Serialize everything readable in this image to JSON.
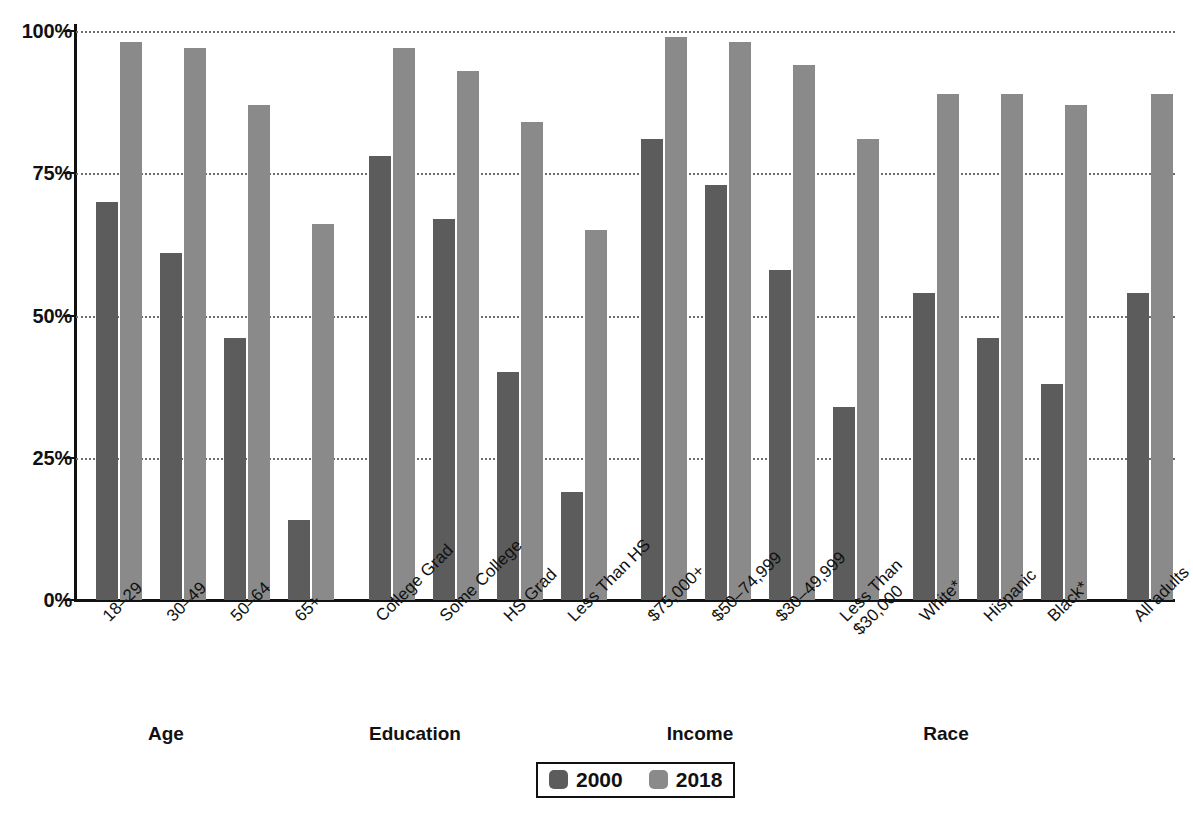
{
  "chart_data": {
    "type": "bar",
    "title": "",
    "xlabel": "",
    "ylabel": "",
    "ylim": [
      0,
      100
    ],
    "ytick_labels": [
      "100%",
      "75%",
      "50%",
      "25%",
      "0%"
    ],
    "ytick_values": [
      100,
      75,
      50,
      25,
      0
    ],
    "grid": true,
    "legend_position": "bottom-center",
    "series": [
      {
        "name": "2000",
        "color": "#5c5c5c",
        "values": [
          70,
          61,
          46,
          14,
          78,
          67,
          40,
          19,
          81,
          73,
          58,
          34,
          54,
          46,
          38,
          54
        ]
      },
      {
        "name": "2018",
        "color": "#8a8a8a",
        "values": [
          98,
          97,
          87,
          66,
          97,
          93,
          84,
          65,
          99,
          98,
          94,
          81,
          89,
          89,
          87,
          89
        ]
      }
    ],
    "categories": [
      "18–29",
      "30–49",
      "50–64",
      "65+",
      "College Grad",
      "Some College",
      "HS Grad",
      "Less Than HS",
      "$75,000+",
      "$50–74,999",
      "$30–49,999",
      "Less Than\n$30,000",
      "White*",
      "Hispanic",
      "Black*",
      "All adults"
    ],
    "groups": [
      {
        "label": "Age",
        "categories": [
          "18–29",
          "30–49",
          "50–64",
          "65+"
        ]
      },
      {
        "label": "Education",
        "categories": [
          "College Grad",
          "Some College",
          "HS Grad",
          "Less Than HS"
        ]
      },
      {
        "label": "Income",
        "categories": [
          "$75,000+",
          "$50–74,999",
          "$30–49,999",
          "Less Than\n$30,000"
        ]
      },
      {
        "label": "Race",
        "categories": [
          "White*",
          "Hispanic",
          "Black*"
        ]
      },
      {
        "label": "",
        "categories": [
          "All adults"
        ]
      }
    ]
  },
  "legend": {
    "entries": [
      {
        "label": "2000",
        "color": "#5c5c5c"
      },
      {
        "label": "2018",
        "color": "#8a8a8a"
      }
    ]
  },
  "axis": {
    "y_ticks": [
      {
        "label": "100%",
        "value": 100
      },
      {
        "label": "75%",
        "value": 75
      },
      {
        "label": "50%",
        "value": 50
      },
      {
        "label": "25%",
        "value": 25
      },
      {
        "label": "0%",
        "value": 0
      }
    ]
  },
  "group_titles": [
    {
      "label": "Age",
      "x": 166
    },
    {
      "label": "Education",
      "x": 415
    },
    {
      "label": "Income",
      "x": 700
    },
    {
      "label": "Race",
      "x": 946
    }
  ],
  "categories_layout": [
    {
      "label": "18–29",
      "x": 96,
      "group": 0
    },
    {
      "label": "30–49",
      "x": 160,
      "group": 0
    },
    {
      "label": "50–64",
      "x": 224,
      "group": 0
    },
    {
      "label": "65+",
      "x": 288,
      "group": 0
    },
    {
      "label": "College Grad",
      "x": 369,
      "group": 1
    },
    {
      "label": "Some College",
      "x": 433,
      "group": 1
    },
    {
      "label": "HS Grad",
      "x": 497,
      "group": 1
    },
    {
      "label": "Less Than HS",
      "x": 561,
      "group": 1
    },
    {
      "label": "$75,000+",
      "x": 641,
      "group": 2
    },
    {
      "label": "$50–74,999",
      "x": 705,
      "group": 2
    },
    {
      "label": "$30–49,999",
      "x": 769,
      "group": 2
    },
    {
      "label": "Less Than\n$30,000",
      "x": 833,
      "group": 2
    },
    {
      "label": "White*",
      "x": 913,
      "group": 3
    },
    {
      "label": "Hispanic",
      "x": 977,
      "group": 3
    },
    {
      "label": "Black*",
      "x": 1041,
      "group": 3
    },
    {
      "label": "All adults",
      "x": 1127,
      "group": 4
    }
  ]
}
